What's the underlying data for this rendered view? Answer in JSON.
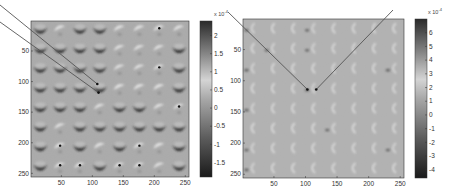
{
  "chart_data": [
    {
      "type": "heatmap",
      "title": "",
      "xlabel": "",
      "ylabel": "",
      "xlim": [
        1,
        256
      ],
      "ylim": [
        256,
        1
      ],
      "x_ticks": [
        50,
        100,
        150,
        200,
        250
      ],
      "y_ticks": [
        50,
        100,
        150,
        200,
        250
      ],
      "x_tick_labels": [
        "50",
        "100",
        "150",
        "200",
        "250"
      ],
      "y_tick_labels": [
        "50",
        "100",
        "150",
        "200",
        "250"
      ],
      "colormap": "gray",
      "colorbar": {
        "exponent_label": "x 10",
        "exponent_power": "-4",
        "range": [
          -1.9,
          2.4
        ],
        "ticks": [
          2,
          1.5,
          1,
          0.5,
          0,
          -0.5,
          -1,
          -1.5
        ],
        "tick_labels": [
          "2",
          "1.5",
          "1",
          "0.5",
          "0",
          "-0.5",
          "-1",
          "-1.5"
        ]
      },
      "background_value": 0,
      "blob_grid": {
        "rows": 8,
        "cols": 8,
        "row_centers": [
          16,
          48,
          80,
          112,
          144,
          176,
          208,
          240
        ],
        "col_centers": [
          16,
          48,
          80,
          112,
          144,
          176,
          208,
          240
        ],
        "legend": "D = dark crescent (negative, ~ -1.7e-4), L = light blob (positive, ~ +1.5e-4), P = light blob with dark dot",
        "pattern": [
          [
            "D",
            "L",
            "D",
            "D",
            "L",
            "L",
            "P",
            "L"
          ],
          [
            "D",
            "D",
            "D",
            "D",
            "L",
            "L",
            "L",
            "D"
          ],
          [
            "D",
            "D",
            "D",
            "D",
            "L",
            "L",
            "P",
            "D"
          ],
          [
            "D",
            "D",
            "D",
            "D",
            "L",
            "L",
            "L",
            "D"
          ],
          [
            "D",
            "D",
            "D",
            "L",
            "D",
            "D",
            "L",
            "P"
          ],
          [
            "D",
            "L",
            "D",
            "D",
            "D",
            "D",
            "D",
            "D"
          ],
          [
            "D",
            "P",
            "D",
            "L",
            "D",
            "P",
            "L",
            "D"
          ],
          [
            "D",
            "P",
            "P",
            "D",
            "P",
            "P",
            "L",
            "D"
          ]
        ]
      },
      "annotations": [
        {
          "type": "line",
          "from": "outside top-left",
          "to_data": [
            108,
            104
          ]
        },
        {
          "type": "line",
          "from": "outside top-left",
          "to_data": [
            110,
            118
          ]
        }
      ]
    },
    {
      "type": "heatmap",
      "title": "",
      "xlabel": "",
      "ylabel": "",
      "xlim": [
        1,
        256
      ],
      "ylim": [
        256,
        1
      ],
      "x_ticks": [
        50,
        100,
        150,
        200,
        250
      ],
      "y_ticks": [
        50,
        100,
        150,
        200,
        250
      ],
      "x_tick_labels": [
        "50",
        "100",
        "150",
        "200",
        "250"
      ],
      "y_tick_labels": [
        "50",
        "100",
        "150",
        "200",
        "250"
      ],
      "colormap": "gray",
      "colorbar": {
        "exponent_label": "x 10",
        "exponent_power": "-4",
        "range": [
          -4.6,
          7
        ],
        "ticks": [
          6,
          5,
          4,
          3,
          2,
          1,
          0,
          -1,
          -2,
          -3,
          -4
        ],
        "tick_labels": [
          "6",
          "5",
          "4",
          "3",
          "2",
          "1",
          "0",
          "-1",
          "-2",
          "-3",
          "-4"
        ]
      },
      "background_value": 0,
      "blob_grid": {
        "rows": 8,
        "cols": 8,
        "row_centers": [
          16,
          48,
          80,
          112,
          144,
          176,
          208,
          240
        ],
        "col_centers": [
          16,
          48,
          80,
          112,
          144,
          176,
          208,
          240
        ],
        "legend": "l = faint light crescent, d = faint dark spot",
        "pattern": [
          [
            "d",
            "l",
            "l",
            "d",
            "l",
            "l",
            "l",
            "l"
          ],
          [
            "l",
            "d",
            "l",
            "d",
            "l",
            "l",
            "l",
            "l"
          ],
          [
            "d",
            "l",
            "l",
            "l",
            "l",
            "l",
            "l",
            "d"
          ],
          [
            "l",
            "l",
            "l",
            "d",
            "l",
            "l",
            "l",
            "l"
          ],
          [
            "d",
            "l",
            "l",
            "l",
            "l",
            "l",
            "l",
            "l"
          ],
          [
            "l",
            "l",
            "l",
            "l",
            "d",
            "l",
            "l",
            "l"
          ],
          [
            "d",
            "l",
            "l",
            "l",
            "l",
            "l",
            "l",
            "d"
          ],
          [
            "d",
            "l",
            "l",
            "l",
            "l",
            "l",
            "l",
            "l"
          ]
        ]
      },
      "annotations": [
        {
          "type": "line",
          "from": "outside top-left",
          "to_data": [
            103,
            114
          ]
        },
        {
          "type": "line",
          "from": "outside top-right",
          "to_data": [
            117,
            114
          ]
        }
      ]
    }
  ]
}
